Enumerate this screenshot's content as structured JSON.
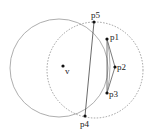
{
  "diagram": {
    "solid_circle": {
      "cx": 59,
      "cy": 68,
      "r": 49,
      "stroke": "#999999"
    },
    "dashed_circle": {
      "cx": 95,
      "cy": 70,
      "r": 48,
      "stroke": "#888888"
    },
    "points": [
      {
        "id": "v",
        "label": "v",
        "x": 63,
        "y": 66,
        "lx": 65,
        "ly": 74
      },
      {
        "id": "p1",
        "label": "p1",
        "x": 107,
        "y": 39,
        "lx": 110,
        "ly": 40
      },
      {
        "id": "p2",
        "label": "p2",
        "x": 115,
        "y": 67,
        "lx": 117,
        "ly": 70
      },
      {
        "id": "p3",
        "label": "p3",
        "x": 107,
        "y": 93,
        "lx": 109,
        "ly": 97
      },
      {
        "id": "p4",
        "label": "p4",
        "x": 85,
        "y": 116,
        "lx": 80,
        "ly": 127
      },
      {
        "id": "p5",
        "label": "p5",
        "x": 94,
        "y": 22,
        "lx": 91,
        "ly": 18
      }
    ],
    "line_color": "#444444"
  }
}
